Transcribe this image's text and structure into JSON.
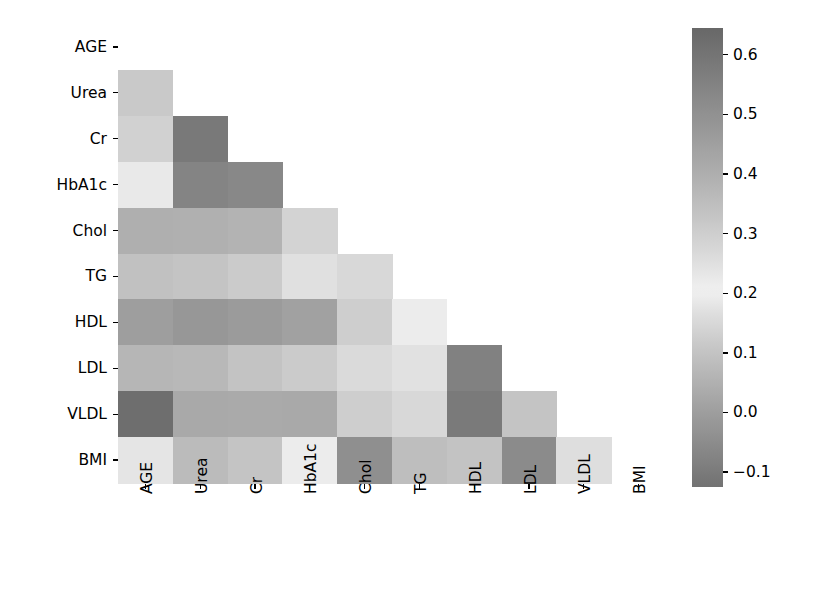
{
  "figure": {
    "type": "heatmap",
    "background": "#ffffff",
    "text_color": "#000000"
  },
  "chart_data": {
    "type": "heatmap",
    "title": "",
    "xlabel": "",
    "ylabel": "",
    "grid": false,
    "mask": "lower-triangle-strict",
    "categories": [
      "AGE",
      "Urea",
      "Cr",
      "HbA1c",
      "Chol",
      "TG",
      "HDL",
      "LDL",
      "VLDL",
      "BMI"
    ],
    "xtick_labels": [
      "AGE",
      "Urea",
      "Cr",
      "HbA1c",
      "Chol",
      "TG",
      "HDL",
      "LDL",
      "VLDL",
      "BMI"
    ],
    "ytick_labels": [
      "AGE",
      "Urea",
      "Cr",
      "HbA1c",
      "Chol",
      "TG",
      "HDL",
      "LDL",
      "VLDL",
      "BMI"
    ],
    "colorbar": {
      "tick_labels": [
        "0.6",
        "0.5",
        "0.4",
        "0.3",
        "0.2",
        "0.1",
        "0.0",
        "−0.1"
      ],
      "tick_values": [
        0.6,
        0.5,
        0.4,
        0.3,
        0.2,
        0.1,
        0.0,
        -0.1
      ],
      "vmin": -0.125,
      "vmax": 0.645,
      "orientation": "vertical",
      "position": "right",
      "colormap": "diverging-grayscale",
      "light_center": 0.205
    },
    "rows": [
      {
        "label": "AGE",
        "values": [
          null,
          null,
          null,
          null,
          null,
          null,
          null,
          null,
          null
        ]
      },
      {
        "label": "Urea",
        "values": [
          0.115,
          null,
          null,
          null,
          null,
          null,
          null,
          null,
          null
        ]
      },
      {
        "label": "Cr",
        "values": [
          0.135,
          0.585,
          null,
          null,
          null,
          null,
          null,
          null,
          null
        ]
      },
      {
        "label": "HbA1c",
        "values": [
          0.225,
          0.545,
          0.53,
          null,
          null,
          null,
          null,
          null,
          null
        ]
      },
      {
        "label": "Chol",
        "values": [
          0.4,
          0.395,
          0.385,
          0.285,
          null,
          null,
          null,
          null,
          null
        ]
      },
      {
        "label": "TG",
        "values": [
          0.095,
          0.33,
          0.31,
          0.17,
          0.15,
          null,
          null,
          null,
          null
        ]
      },
      {
        "label": "HDL",
        "values": [
          0.455,
          0.48,
          0.465,
          0.445,
          0.3,
          0.195,
          null,
          null,
          null
        ]
      },
      {
        "label": "LDL",
        "values": [
          0.375,
          0.37,
          0.335,
          0.31,
          0.265,
          0.245,
          0.555,
          null,
          null
        ]
      },
      {
        "label": "VLDL",
        "values": [
          0.625,
          0.42,
          0.415,
          0.42,
          0.3,
          0.15,
          0.58,
          0.33,
          null
        ]
      },
      {
        "label": "BMI",
        "values": [
          0.18,
          0.36,
          0.33,
          0.195,
          0.505,
          0.35,
          0.335,
          0.52,
          0.165
        ]
      }
    ]
  },
  "layout": {
    "plot_left": 118,
    "plot_top": 24,
    "cell_w": 54.8,
    "cell_h": 45.9,
    "n": 10,
    "cbar_left": 692,
    "cbar_top": 28,
    "cbar_w": 31,
    "cbar_h": 459
  }
}
